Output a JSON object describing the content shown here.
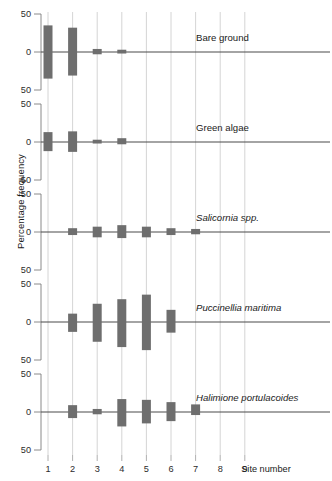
{
  "figure": {
    "ylabel": "Percentage frequency",
    "xlabel": "Site number",
    "ytick_labels": [
      "50",
      "0",
      "50"
    ],
    "xtick_labels": [
      "1",
      "2",
      "3",
      "4",
      "5",
      "6",
      "7",
      "8",
      "9"
    ],
    "bar_color": "#6e6e6e",
    "gridline_color": "#c9c9c9",
    "zeroline_color": "#4a4a4a"
  },
  "chart_data": {
    "type": "bar",
    "title": "",
    "xlabel": "Site number",
    "ylabel": "Percentage frequency",
    "categories": [
      1,
      2,
      3,
      4,
      5,
      6,
      7,
      8,
      9
    ],
    "ylim": [
      -50,
      50
    ],
    "ytick_values": [
      50,
      0,
      -50
    ],
    "ytick_labels": [
      "50",
      "0",
      "50"
    ],
    "grid": true,
    "legend": "none",
    "note": "Each panel is a symmetric (mirrored about zero) percentage-frequency bar for one cover category at each of 9 sites. Values are the extent above and below the zero line.",
    "panels": [
      {
        "name": "Bare ground",
        "italic": false,
        "series": [
          {
            "name": "up",
            "values": [
              35,
              32,
              4,
              3,
              0,
              0,
              0,
              0,
              0
            ]
          },
          {
            "name": "down",
            "values": [
              35,
              31,
              3,
              2,
              0,
              0,
              0,
              0,
              0
            ]
          }
        ]
      },
      {
        "name": "Green algae",
        "italic": false,
        "series": [
          {
            "name": "up",
            "values": [
              13,
              14,
              3,
              5,
              0,
              0,
              0,
              0,
              0
            ]
          },
          {
            "name": "down",
            "values": [
              12,
              13,
              2,
              3,
              0,
              0,
              0,
              0,
              0
            ]
          }
        ]
      },
      {
        "name": "Salicornia spp.",
        "italic": true,
        "series": [
          {
            "name": "up",
            "values": [
              0,
              5,
              7,
              9,
              7,
              5,
              4,
              0,
              0
            ]
          },
          {
            "name": "down",
            "values": [
              0,
              4,
              7,
              8,
              7,
              4,
              3,
              0,
              0
            ]
          }
        ]
      },
      {
        "name": "Puccinellia maritima",
        "italic": true,
        "series": [
          {
            "name": "up",
            "values": [
              0,
              11,
              24,
              30,
              36,
              16,
              0,
              0,
              0
            ]
          },
          {
            "name": "down",
            "values": [
              0,
              13,
              26,
              33,
              37,
              14,
              0,
              0,
              0
            ]
          }
        ]
      },
      {
        "name": "Halimione portulacoides",
        "italic": true,
        "series": [
          {
            "name": "up",
            "values": [
              0,
              9,
              4,
              17,
              16,
              13,
              10,
              0,
              0
            ]
          },
          {
            "name": "down",
            "values": [
              0,
              8,
              3,
              19,
              15,
              12,
              4,
              0,
              0
            ]
          }
        ]
      }
    ]
  }
}
